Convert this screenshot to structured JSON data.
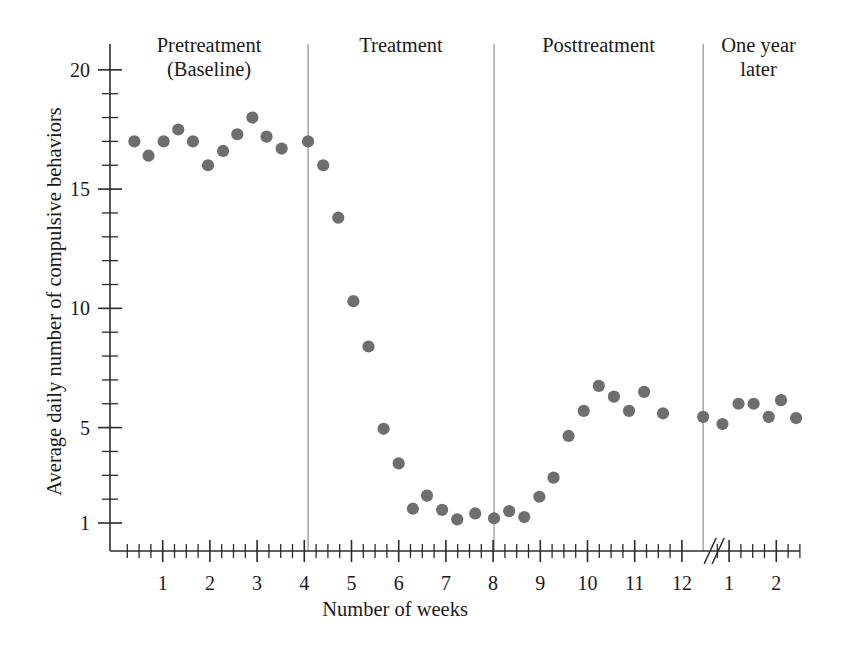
{
  "chart_data": {
    "type": "scatter",
    "title": "",
    "xlabel": "Number of weeks",
    "ylabel": "Average daily number of compulsive behaviors",
    "xlim": [
      0,
      14.5
    ],
    "ylim": [
      0.2,
      21.0
    ],
    "grid": false,
    "legend": "none",
    "marker_color": "#6e6e6e",
    "marker_shape": "circle",
    "y_ticks_major": [
      1,
      5,
      10,
      15,
      20
    ],
    "y_ticks_major_labels": [
      "1",
      "5",
      "10",
      "15",
      "20"
    ],
    "y_ticks_minor": [
      2,
      3,
      4,
      6,
      7,
      8,
      9,
      11,
      12,
      13,
      14,
      16,
      17,
      18,
      19
    ],
    "x_ticks_major": [
      1,
      2,
      3,
      4,
      5,
      6,
      7,
      8,
      9,
      10,
      11,
      12,
      13,
      14
    ],
    "x_ticks_major_labels": [
      "1",
      "2",
      "3",
      "4",
      "5",
      "6",
      "7",
      "8",
      "9",
      "10",
      "11",
      "12",
      "1",
      "2"
    ],
    "x_axis_break": {
      "present": true,
      "after_label": "12",
      "position": 12.45,
      "glyph": "//"
    },
    "phase_dividers": [
      4.08,
      8.02,
      12.45
    ],
    "phases": [
      {
        "id": "pretreatment",
        "label": "Pretreatment\n(Baseline)",
        "x_start": 0.0,
        "x_end": 4.08
      },
      {
        "id": "treatment",
        "label": "Treatment",
        "x_start": 4.08,
        "x_end": 8.02
      },
      {
        "id": "posttreatment",
        "label": "Posttreatment",
        "x_start": 8.02,
        "x_end": 12.45
      },
      {
        "id": "one-year-later",
        "label": "One year\nlater",
        "x_start": 12.45,
        "x_end": 14.5
      }
    ],
    "points": [
      {
        "x": 0.4,
        "y": 17.0,
        "phase": "pretreatment"
      },
      {
        "x": 0.7,
        "y": 16.4,
        "phase": "pretreatment"
      },
      {
        "x": 1.02,
        "y": 17.0,
        "phase": "pretreatment"
      },
      {
        "x": 1.33,
        "y": 17.5,
        "phase": "pretreatment"
      },
      {
        "x": 1.64,
        "y": 17.0,
        "phase": "pretreatment"
      },
      {
        "x": 1.96,
        "y": 16.0,
        "phase": "pretreatment"
      },
      {
        "x": 2.28,
        "y": 16.6,
        "phase": "pretreatment"
      },
      {
        "x": 2.58,
        "y": 17.3,
        "phase": "pretreatment"
      },
      {
        "x": 2.9,
        "y": 18.0,
        "phase": "pretreatment"
      },
      {
        "x": 3.2,
        "y": 17.2,
        "phase": "pretreatment"
      },
      {
        "x": 3.52,
        "y": 16.7,
        "phase": "pretreatment"
      },
      {
        "x": 4.08,
        "y": 17.0,
        "phase": "pretreatment"
      },
      {
        "x": 4.4,
        "y": 16.0,
        "phase": "treatment"
      },
      {
        "x": 4.72,
        "y": 13.8,
        "phase": "treatment"
      },
      {
        "x": 5.04,
        "y": 10.3,
        "phase": "treatment"
      },
      {
        "x": 5.36,
        "y": 8.4,
        "phase": "treatment"
      },
      {
        "x": 5.68,
        "y": 4.95,
        "phase": "treatment"
      },
      {
        "x": 6.0,
        "y": 3.5,
        "phase": "treatment"
      },
      {
        "x": 6.3,
        "y": 1.6,
        "phase": "treatment"
      },
      {
        "x": 6.6,
        "y": 2.15,
        "phase": "treatment"
      },
      {
        "x": 6.92,
        "y": 1.55,
        "phase": "treatment"
      },
      {
        "x": 7.24,
        "y": 1.15,
        "phase": "treatment"
      },
      {
        "x": 7.62,
        "y": 1.4,
        "phase": "treatment"
      },
      {
        "x": 8.02,
        "y": 1.2,
        "phase": "treatment"
      },
      {
        "x": 8.34,
        "y": 1.5,
        "phase": "posttreatment"
      },
      {
        "x": 8.66,
        "y": 1.25,
        "phase": "posttreatment"
      },
      {
        "x": 8.98,
        "y": 2.1,
        "phase": "posttreatment"
      },
      {
        "x": 9.28,
        "y": 2.9,
        "phase": "posttreatment"
      },
      {
        "x": 9.6,
        "y": 4.65,
        "phase": "posttreatment"
      },
      {
        "x": 9.92,
        "y": 5.7,
        "phase": "posttreatment"
      },
      {
        "x": 10.24,
        "y": 6.75,
        "phase": "posttreatment"
      },
      {
        "x": 10.56,
        "y": 6.3,
        "phase": "posttreatment"
      },
      {
        "x": 10.88,
        "y": 5.7,
        "phase": "posttreatment"
      },
      {
        "x": 11.2,
        "y": 6.5,
        "phase": "posttreatment"
      },
      {
        "x": 11.6,
        "y": 5.6,
        "phase": "posttreatment"
      },
      {
        "x": 12.45,
        "y": 5.45,
        "phase": "posttreatment"
      },
      {
        "x": 12.86,
        "y": 5.15,
        "phase": "one-year-later"
      },
      {
        "x": 13.2,
        "y": 6.0,
        "phase": "one-year-later"
      },
      {
        "x": 13.52,
        "y": 6.0,
        "phase": "one-year-later"
      },
      {
        "x": 13.84,
        "y": 5.45,
        "phase": "one-year-later"
      },
      {
        "x": 14.1,
        "y": 6.15,
        "phase": "one-year-later"
      },
      {
        "x": 14.42,
        "y": 5.4,
        "phase": "one-year-later"
      }
    ]
  }
}
